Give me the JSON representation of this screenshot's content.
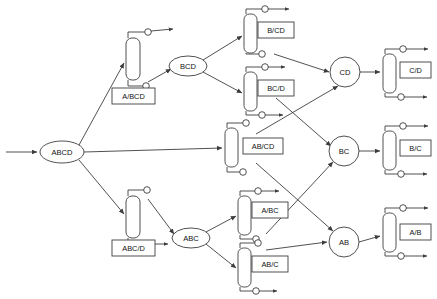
{
  "diagram": {
    "background_color": "#ffffff",
    "line_color": "#3d3d3d",
    "text_color": "#111111",
    "width": 437,
    "height": 299,
    "nodes": [
      {
        "id": "ABCD",
        "label": "ABCD",
        "shape": "ellipse",
        "cx": 62,
        "cy": 152,
        "rx": 22,
        "ry": 11
      },
      {
        "id": "BCD",
        "label": "BCD",
        "shape": "ellipse",
        "cx": 188,
        "cy": 66,
        "rx": 19,
        "ry": 10
      },
      {
        "id": "ABC",
        "label": "ABC",
        "shape": "ellipse",
        "cx": 191,
        "cy": 238,
        "rx": 19,
        "ry": 10
      },
      {
        "id": "CD",
        "label": "CD",
        "shape": "circle",
        "cx": 345,
        "cy": 72,
        "rx": 15,
        "ry": 15
      },
      {
        "id": "BC",
        "label": "BC",
        "shape": "circle",
        "cx": 344,
        "cy": 151,
        "rx": 15,
        "ry": 15
      },
      {
        "id": "AB",
        "label": "AB",
        "shape": "circle",
        "cx": 344,
        "cy": 242,
        "rx": 15,
        "ry": 15
      }
    ],
    "columns": [
      {
        "id": "A/BCD",
        "label": "A/BCD",
        "x": 126,
        "y": 38,
        "w": 14,
        "h": 42,
        "label_box": {
          "x": 112,
          "y": 88,
          "w": 43,
          "h": 16
        }
      },
      {
        "id": "ABC/D",
        "label": "ABC/D",
        "x": 126,
        "y": 196,
        "w": 14,
        "h": 42,
        "label_box": {
          "x": 112,
          "y": 240,
          "w": 43,
          "h": 16
        }
      },
      {
        "id": "B/CD",
        "label": "B/CD",
        "x": 244,
        "y": 14,
        "w": 13,
        "h": 39,
        "label_box": {
          "x": 258,
          "y": 22,
          "w": 36,
          "h": 16
        }
      },
      {
        "id": "BC/D",
        "label": "BC/D",
        "x": 244,
        "y": 72,
        "w": 13,
        "h": 39,
        "label_box": {
          "x": 258,
          "y": 80,
          "w": 36,
          "h": 16
        }
      },
      {
        "id": "AB/CD",
        "label": "AB/CD",
        "x": 225,
        "y": 128,
        "w": 13,
        "h": 39,
        "label_box": {
          "x": 243,
          "y": 138,
          "w": 40,
          "h": 16
        }
      },
      {
        "id": "A/BC",
        "label": "A/BC",
        "x": 238,
        "y": 196,
        "w": 13,
        "h": 39,
        "label_box": {
          "x": 252,
          "y": 202,
          "w": 36,
          "h": 16
        }
      },
      {
        "id": "AB/C",
        "label": "AB/C",
        "x": 238,
        "y": 248,
        "w": 13,
        "h": 39,
        "label_box": {
          "x": 252,
          "y": 256,
          "w": 36,
          "h": 16
        }
      },
      {
        "id": "C/D",
        "label": "C/D",
        "x": 383,
        "y": 54,
        "w": 13,
        "h": 39,
        "label_box": {
          "x": 400,
          "y": 62,
          "w": 31,
          "h": 16
        }
      },
      {
        "id": "B/C",
        "label": "B/C",
        "x": 383,
        "y": 131,
        "w": 13,
        "h": 39,
        "label_box": {
          "x": 400,
          "y": 140,
          "w": 31,
          "h": 16
        }
      },
      {
        "id": "A/B",
        "label": "A/B",
        "x": 383,
        "y": 213,
        "w": 13,
        "h": 39,
        "label_box": {
          "x": 400,
          "y": 224,
          "w": 31,
          "h": 16
        }
      }
    ],
    "edges": [
      {
        "from": "feed",
        "to": "ABCD",
        "kind": "feed-arrow"
      },
      {
        "from": "ABCD",
        "to": "A/BCD",
        "kind": "link"
      },
      {
        "from": "ABCD",
        "to": "AB/CD",
        "kind": "link"
      },
      {
        "from": "ABCD",
        "to": "ABC/D",
        "kind": "link"
      },
      {
        "from": "A/BCD",
        "to": "BCD",
        "kind": "link"
      },
      {
        "from": "ABC/D",
        "to": "ABC",
        "kind": "link"
      },
      {
        "from": "BCD",
        "to": "B/CD",
        "kind": "link"
      },
      {
        "from": "BCD",
        "to": "BC/D",
        "kind": "link"
      },
      {
        "from": "B/CD",
        "to": "CD",
        "kind": "link"
      },
      {
        "from": "BC/D",
        "to": "BC",
        "kind": "link"
      },
      {
        "from": "AB/CD",
        "to": "CD",
        "kind": "link"
      },
      {
        "from": "AB/CD",
        "to": "AB",
        "kind": "link"
      },
      {
        "from": "ABC",
        "to": "A/BC",
        "kind": "link"
      },
      {
        "from": "ABC",
        "to": "AB/C",
        "kind": "link"
      },
      {
        "from": "A/BC",
        "to": "BC",
        "kind": "link"
      },
      {
        "from": "AB/C",
        "to": "AB",
        "kind": "link"
      },
      {
        "from": "CD",
        "to": "C/D",
        "kind": "link"
      },
      {
        "from": "BC",
        "to": "B/C",
        "kind": "link"
      },
      {
        "from": "AB",
        "to": "A/B",
        "kind": "link"
      }
    ]
  }
}
